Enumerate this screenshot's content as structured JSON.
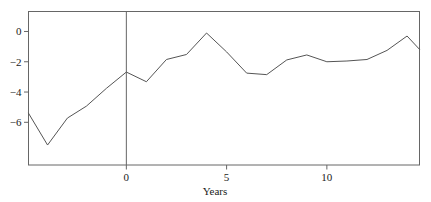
{
  "chart_data": {
    "type": "line",
    "title": "",
    "subtitle": "",
    "xlabel": "Years",
    "ylabel": "",
    "grid": false,
    "legend": null,
    "xlim": [
      -4.88,
      14.62
    ],
    "ylim": [
      -8.82,
      1.32
    ],
    "xticks": [
      0,
      5,
      10
    ],
    "xtick_labels": [
      "0",
      "5",
      "10"
    ],
    "yticks": [
      0,
      -2,
      -4,
      -6
    ],
    "ytick_labels": [
      "0",
      "−2",
      "−4",
      "−6"
    ],
    "annotations": [
      {
        "name": "event-reference-line",
        "type": "vline",
        "x": 0
      }
    ],
    "series": [
      {
        "name": "series-1",
        "color": "#555555",
        "x": [
          -4.88,
          -3.93,
          -2.94,
          -1.99,
          -0.99,
          0,
          1,
          2,
          3,
          4,
          5,
          6,
          7,
          8,
          9,
          10,
          11,
          12,
          13,
          14,
          14.62
        ],
        "values": [
          -5.4,
          -7.5,
          -5.72,
          -4.93,
          -3.75,
          -2.68,
          -3.32,
          -1.85,
          -1.52,
          -0.1,
          -1.35,
          -2.75,
          -2.85,
          -1.88,
          -1.55,
          -2.0,
          -1.95,
          -1.85,
          -1.25,
          -0.3,
          -1.18
        ]
      }
    ]
  },
  "axes": {
    "x_axis_label": "Years",
    "x_tick_values": [
      "0",
      "5",
      "10"
    ],
    "y_tick_values": [
      "0",
      "−2",
      "−4",
      "−6"
    ]
  },
  "style": {
    "line_color": "#555555",
    "frame_color": "#666666",
    "text_color": "#1a1a1a",
    "background": "#ffffff"
  }
}
